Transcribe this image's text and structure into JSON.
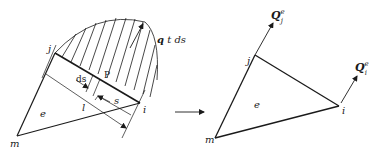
{
  "left_panel": {
    "load_label_q": "q",
    "load_label_rest": " t ds",
    "node_i": "i",
    "node_j": "j",
    "node_m": "m",
    "element": "e",
    "dim_ds": "ds",
    "point_p": "P",
    "dim_s": "s",
    "dim_l": "l"
  },
  "right_panel": {
    "node_i": "i",
    "node_j": "j",
    "node_m": "m",
    "element": "e",
    "force_j_main": "Q",
    "force_j_sup": "e",
    "force_j_sub": "j",
    "force_i_main": "Q",
    "force_i_sup": "e",
    "force_i_sub": "i"
  },
  "colors": {
    "line": "#1a1a1a",
    "background": "#ffffff"
  }
}
